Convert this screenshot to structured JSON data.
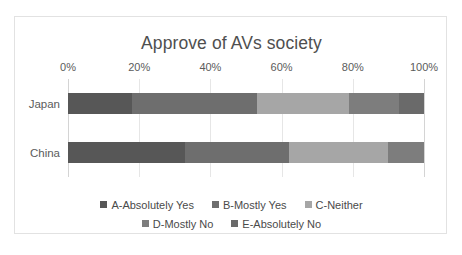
{
  "chart_data": {
    "type": "bar",
    "orientation": "horizontal",
    "stacked": true,
    "normalized": true,
    "title": "Approve of AVs society",
    "xlabel": "",
    "ylabel": "",
    "categories": [
      "Japan",
      "China"
    ],
    "xlim": [
      0,
      100
    ],
    "xticks": [
      0,
      20,
      40,
      60,
      80,
      100
    ],
    "xticklabels": [
      "0%",
      "20%",
      "40%",
      "60%",
      "80%",
      "100%"
    ],
    "grid": true,
    "legend_position": "bottom",
    "series": [
      {
        "name": "A-Absolutely Yes",
        "color": "#575757",
        "values": [
          18,
          33
        ]
      },
      {
        "name": "B-Mostly Yes",
        "color": "#6e6e6e",
        "values": [
          35,
          29
        ]
      },
      {
        "name": "C-Neither",
        "color": "#a6a6a6",
        "values": [
          26,
          28
        ]
      },
      {
        "name": "D-Mostly No",
        "color": "#7d7d7d",
        "values": [
          14,
          10
        ]
      },
      {
        "name": "E-Absolutely No",
        "color": "#6a6a6a",
        "values": [
          7,
          0
        ]
      }
    ]
  },
  "chart": {
    "title": "Approve of AVs society",
    "border_color": "#e2e2e2",
    "gridline_color": "#e6e6e6",
    "axis_color": "#d4d4d4",
    "text_color": "#5b5b5b",
    "ticks": [
      {
        "label": "0%",
        "value": 0
      },
      {
        "label": "20%",
        "value": 20
      },
      {
        "label": "40%",
        "value": 40
      },
      {
        "label": "60%",
        "value": 60
      },
      {
        "label": "80%",
        "value": 80
      },
      {
        "label": "100%",
        "value": 100
      }
    ],
    "categories": [
      {
        "label": "Japan"
      },
      {
        "label": "China"
      }
    ],
    "legend": {
      "rows": [
        [
          {
            "label": "A-Absolutely Yes",
            "color": "#575757"
          },
          {
            "label": "B-Mostly Yes",
            "color": "#6e6e6e"
          },
          {
            "label": "C-Neither",
            "color": "#a6a6a6"
          }
        ],
        [
          {
            "label": "D-Mostly No",
            "color": "#7d7d7d"
          },
          {
            "label": "E-Absolutely No",
            "color": "#6a6a6a"
          }
        ]
      ]
    }
  }
}
